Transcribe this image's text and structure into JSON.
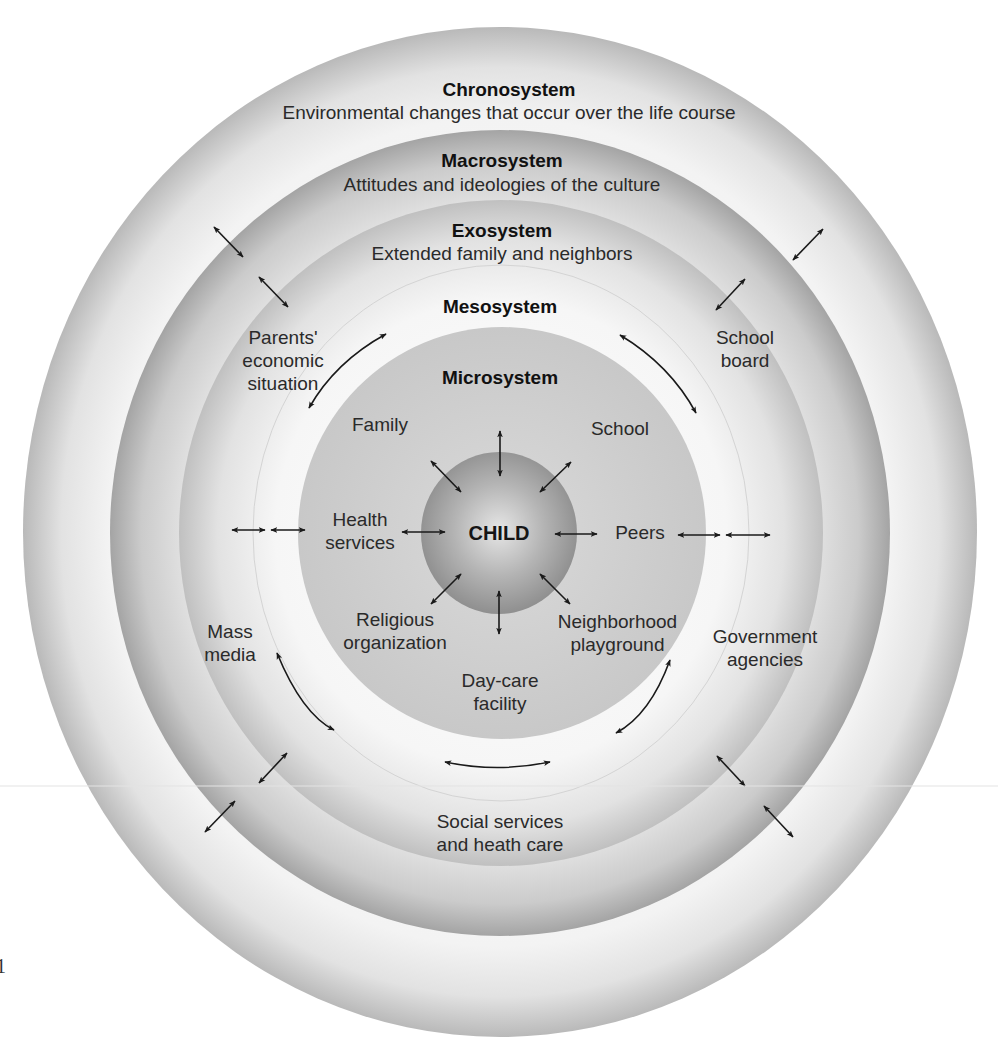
{
  "diagram": {
    "layers": {
      "chronosystem": {
        "title": "Chronosystem",
        "description": "Environmental changes that occur over the life course",
        "color": "#bdbdbd"
      },
      "macrosystem": {
        "title": "Macrosystem",
        "description": "Attitudes and ideologies of the culture",
        "color": "#a8a8a8"
      },
      "exosystem": {
        "title": "Exosystem",
        "description": "Extended family and neighbors",
        "color": "#c6c6c6"
      },
      "mesosystem": {
        "title": "Mesosystem",
        "color": "#efefef"
      },
      "microsystem": {
        "title": "Microsystem",
        "color": "#c9c9c9"
      },
      "center": {
        "title": "CHILD",
        "color": "#9a9a9a"
      }
    },
    "microsystem_items": {
      "family": "Family",
      "school": "School",
      "health_1": "Health",
      "health_2": "services",
      "peers": "Peers",
      "religious_1": "Religious",
      "religious_2": "organization",
      "neighborhood_1": "Neighborhood",
      "neighborhood_2": "playground",
      "daycare_1": "Day-care",
      "daycare_2": "facility"
    },
    "exosystem_items": {
      "parents_1": "Parents'",
      "parents_2": "economic",
      "parents_3": "situation",
      "school_board_1": "School",
      "school_board_2": "board",
      "mass_media_1": "Mass",
      "mass_media_2": "media",
      "government_1": "Government",
      "government_2": "agencies",
      "social_1": "Social services",
      "social_2": "and heath care"
    },
    "arrow_color": "#1a1a1a",
    "page_fragment": "1"
  }
}
